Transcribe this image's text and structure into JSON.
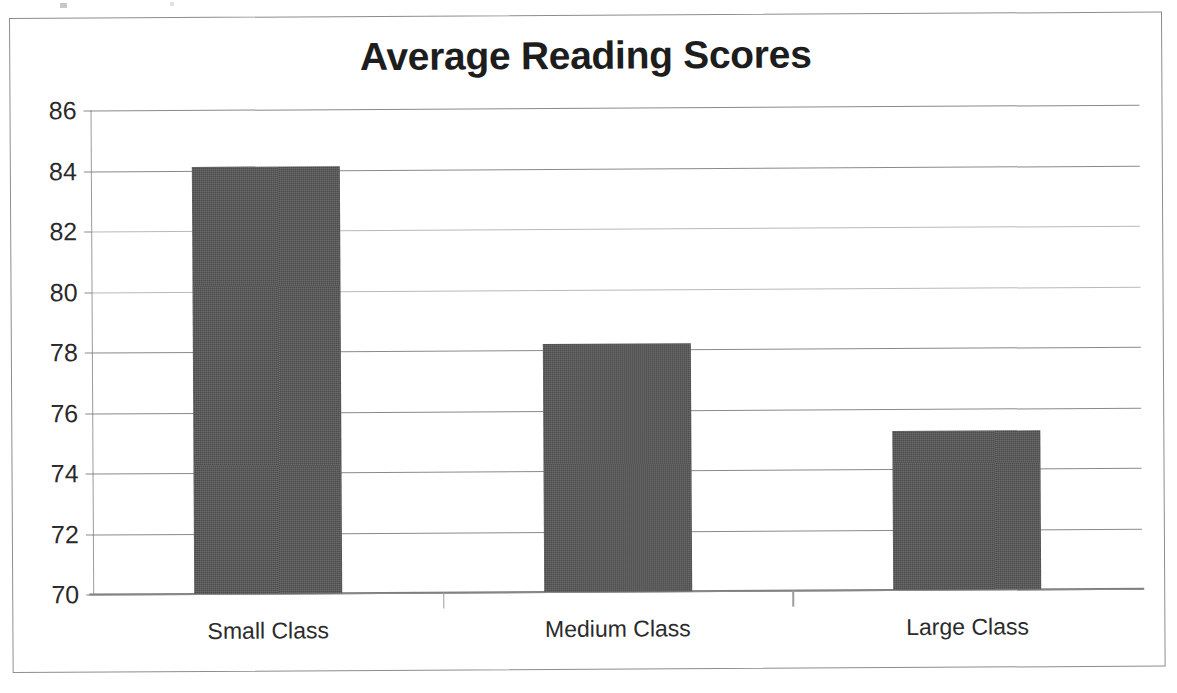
{
  "chart_data": {
    "type": "bar",
    "title": "Average Reading Scores",
    "xlabel": "",
    "ylabel": "",
    "categories": [
      "Small Class",
      "Medium Class",
      "Large Class"
    ],
    "values": [
      84.1,
      78.2,
      75.25
    ],
    "series": [
      {
        "name": "Average Reading Score",
        "values": [
          84.1,
          78.2,
          75.25
        ]
      }
    ],
    "ylim": [
      70,
      86
    ],
    "ytick_step": 2,
    "yticks": [
      86,
      84,
      82,
      80,
      78,
      76,
      74,
      72,
      70
    ],
    "ytick_labels": [
      "86",
      "84",
      "82",
      "80",
      "78",
      "76",
      "74",
      "72",
      "70"
    ],
    "grid": true,
    "grid_axis": "y",
    "legend": false,
    "legend_position": "none",
    "bar_color": "#4c4c4c",
    "gridline_color": "#8a8a8a",
    "axis_color": "#9b9b9b",
    "title_color": "#1d1d1d",
    "background": "#ffffff"
  }
}
